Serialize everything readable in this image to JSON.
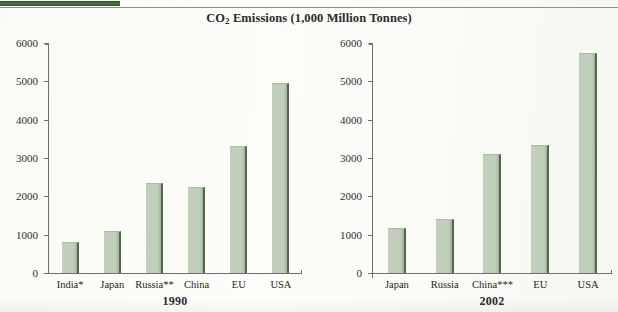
{
  "page": {
    "header_tab_color": "#3a5a32",
    "cut_off_header_text": "",
    "rule_color": "#8f8f8a"
  },
  "chart_title": {
    "prefix": "CO",
    "subscript": "2",
    "suffix": " Emissions (1,000 Million Tonnes)"
  },
  "colors": {
    "bar_fill": "#c3cfbd",
    "bar_edge": "#4e6b43",
    "axis": "#6f6f6b",
    "text": "#2b2b2b"
  },
  "chart_data": [
    {
      "type": "bar",
      "title": "CO2 Emissions (1,000 Million Tonnes)",
      "panel_label": "1990",
      "xlabel": "1990",
      "ylabel": "",
      "ylim": [
        0,
        6000
      ],
      "yticks": [
        0,
        1000,
        2000,
        3000,
        4000,
        5000,
        6000
      ],
      "ytick_labels": [
        "0",
        "1000",
        "2000",
        "3000",
        "4000",
        "5000",
        "6000"
      ],
      "grid": false,
      "legend": "none",
      "categories": [
        "India*",
        "Japan",
        "Russia**",
        "China",
        "EU",
        "USA"
      ],
      "values": [
        780,
        1070,
        2320,
        2230,
        3290,
        4950
      ]
    },
    {
      "type": "bar",
      "title": "CO2 Emissions (1,000 Million Tonnes)",
      "panel_label": "2002",
      "xlabel": "2002",
      "ylabel": "",
      "ylim": [
        0,
        6000
      ],
      "yticks": [
        0,
        1000,
        2000,
        3000,
        4000,
        5000,
        6000
      ],
      "ytick_labels": [
        "0",
        "1000",
        "2000",
        "3000",
        "4000",
        "5000",
        "6000"
      ],
      "grid": false,
      "legend": "none",
      "categories": [
        "Japan",
        "Russia",
        "China***",
        "EU",
        "USA"
      ],
      "values": [
        1160,
        1400,
        3080,
        3320,
        5750
      ]
    }
  ]
}
